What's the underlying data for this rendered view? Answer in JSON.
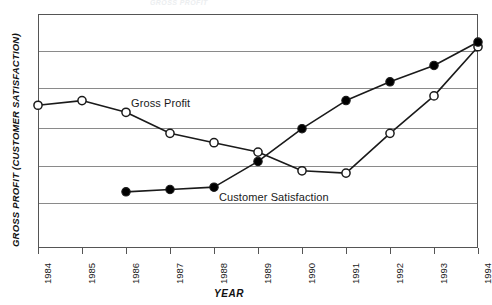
{
  "figure": {
    "faint_top_text": "GROSS PROFIT",
    "frame": {
      "left": 38,
      "top": 14,
      "right": 478,
      "bottom": 248
    }
  },
  "axes": {
    "x_title": "YEAR",
    "y_title": "GROSS PROFIT (CUSTOMER SATISFACTION)"
  },
  "labels": {
    "gross_profit": "Gross Profit",
    "customer_satisfaction": "Customer Satisfaction"
  },
  "colors": {
    "line": "#1a1a1a",
    "grid": "#8a8a8a",
    "frame": "#555555",
    "marker_open_fill": "#ffffff",
    "marker_filled_fill": "#000000",
    "background": "#ffffff"
  },
  "chart_data": {
    "type": "line",
    "title": "",
    "xlabel": "YEAR",
    "ylabel": "GROSS PROFIT (CUSTOMER SATISFACTION)",
    "categories": [
      "1984",
      "1985",
      "1986",
      "1987",
      "1988",
      "1989",
      "1990",
      "1991",
      "1992",
      "1993",
      "1994"
    ],
    "x": [
      1984,
      1985,
      1986,
      1987,
      1988,
      1989,
      1990,
      1991,
      1992,
      1993,
      1994
    ],
    "ylim": [
      0,
      100
    ],
    "xlim": [
      1984,
      1994
    ],
    "grid": true,
    "gridlines_y": [
      100,
      84,
      68,
      51,
      35,
      19,
      0
    ],
    "legend": "inline-annotations",
    "series": [
      {
        "name": "Gross Profit",
        "marker": "open-circle",
        "values": [
          61,
          63,
          58,
          49,
          45,
          41,
          33,
          32,
          49,
          65,
          86
        ],
        "points_present": [
          true,
          true,
          true,
          true,
          true,
          true,
          true,
          true,
          true,
          true,
          true
        ]
      },
      {
        "name": "Customer Satisfaction",
        "marker": "filled-circle",
        "values": [
          null,
          null,
          24,
          25,
          26,
          37,
          51,
          63,
          71,
          78,
          88
        ],
        "points_present": [
          false,
          false,
          true,
          true,
          true,
          true,
          true,
          true,
          true,
          true,
          true
        ]
      }
    ],
    "annotations": [
      {
        "text": "Gross Profit",
        "x": 1986.9,
        "y": 62
      },
      {
        "text": "Customer Satisfaction",
        "x": 1989.4,
        "y": 22
      }
    ]
  }
}
